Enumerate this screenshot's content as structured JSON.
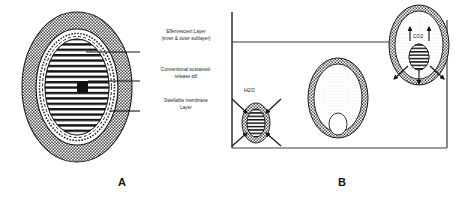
{
  "figure": {
    "panels": [
      {
        "id": "A",
        "caption": "A",
        "description": "Cross-section of gastro-retentive floating tablet",
        "labels": [
          {
            "id": "effervescent",
            "line1": "Effervescent Layer",
            "line2": "(inner & outer sublayer)"
          },
          {
            "id": "pill",
            "line1": "Conventional sustained-",
            "line2": "release pill"
          },
          {
            "id": "swellable",
            "line1": "Swellable membrane",
            "line2": "Layer"
          }
        ]
      },
      {
        "id": "B",
        "caption": "B",
        "description": "Flotation mechanism of the tablet in gastric fluid",
        "annotations": [
          {
            "id": "water-uptake",
            "text": "H2O"
          },
          {
            "id": "gas-generation",
            "text": "CO2"
          }
        ]
      }
    ]
  },
  "colors": {
    "ink": "#111111",
    "stipple": "#4a4a4a",
    "stipple_light": "#8d8d8d",
    "core_fill": "#ffffff",
    "background": "#ffffff"
  }
}
